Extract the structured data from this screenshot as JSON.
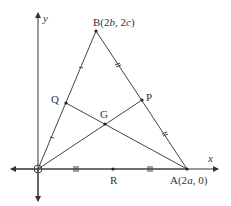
{
  "diagram": {
    "axes": {
      "x_label": "x",
      "y_label": "y"
    },
    "points": {
      "O": {
        "label": "",
        "x": 38,
        "y": 169
      },
      "A": {
        "label": "A(2a, 0)",
        "name": "A",
        "coord": "(2a, 0)",
        "x": 187,
        "y": 169
      },
      "B": {
        "label": "B(2b, 2c)",
        "name": "B",
        "coord": "(2b, 2c)",
        "x": 96,
        "y": 31
      },
      "P": {
        "label": "P",
        "x": 142,
        "y": 100
      },
      "Q": {
        "label": "Q",
        "x": 66,
        "y": 103
      },
      "R": {
        "label": "R",
        "x": 113,
        "y": 169
      },
      "G": {
        "label": "G",
        "x": 105,
        "y": 124
      }
    },
    "tick_marks": {
      "OQ_QB": "single",
      "BP_PA": "double",
      "OR_RA": "triple"
    }
  }
}
